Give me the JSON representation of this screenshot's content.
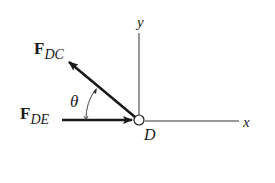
{
  "diagram": {
    "point": {
      "label": "D"
    },
    "axes": {
      "x_label": "x",
      "y_label": "y"
    },
    "forces": [
      {
        "symbol": "F",
        "subscript": "DC",
        "direction": "up-left, toward C"
      },
      {
        "symbol": "F",
        "subscript": "DE",
        "direction": "horizontal, toward D"
      }
    ],
    "angle": {
      "symbol": "θ",
      "between": [
        "F_DC",
        "F_DE"
      ]
    },
    "colors": {
      "ink": "#1a1a1a",
      "background": "#ffffff"
    }
  }
}
